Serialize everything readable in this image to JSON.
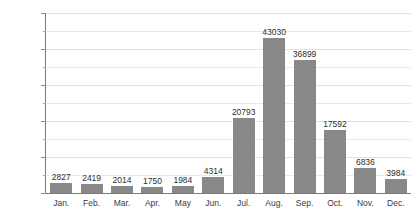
{
  "chart_data": {
    "type": "bar",
    "title": "",
    "xlabel": "",
    "ylabel": "",
    "ylim": [
      0,
      50000
    ],
    "grid": true,
    "legend": "none",
    "y_major_step": 10000,
    "y_minor_step": 5000,
    "y_tick_labels": [
      "50000",
      "40000",
      "30000",
      "20000",
      "10000",
      "0"
    ],
    "y_tick_values": [
      50000,
      40000,
      30000,
      20000,
      10000,
      0
    ],
    "categories": [
      "Jan.",
      "Feb.",
      "Mar.",
      "Apr.",
      "May",
      "Jun.",
      "Jul.",
      "Aug.",
      "Sep.",
      "Oct.",
      "Nov.",
      "Dec."
    ],
    "values": [
      2827,
      2419,
      2014,
      1750,
      1984,
      4314,
      20793,
      43030,
      36899,
      17592,
      6836,
      3984
    ],
    "value_labels": [
      "2827",
      "2419",
      "2014",
      "1750",
      "1984",
      "4314",
      "20793",
      "43030",
      "36899",
      "17592",
      "6836",
      "3984"
    ],
    "bar_color": "#888888",
    "axis_color": "#7a7a7a",
    "gridline_color": "#e9e9e9",
    "text_color": "#3a3a3a",
    "background_color": "#ffffff"
  }
}
